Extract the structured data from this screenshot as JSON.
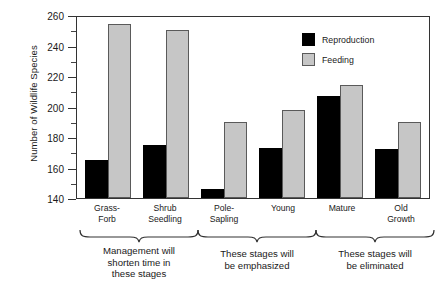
{
  "chart_data": {
    "type": "bar",
    "title": "",
    "xlabel": "",
    "ylabel": "Number of Wildlife Species",
    "ylim": [
      140,
      260
    ],
    "ytick_step": 20,
    "yticks": [
      140,
      160,
      180,
      200,
      220,
      240,
      260
    ],
    "minor_ticks": true,
    "grid": false,
    "legend_position": "top-right",
    "categories": [
      "Grass-\nForb",
      "Shrub\nSeedling",
      "Pole-\nSapling",
      "Young",
      "Mature",
      "Old\nGrowth"
    ],
    "series": [
      {
        "name": "Reproduction",
        "color": "#000000",
        "values": [
          165,
          175,
          146,
          173,
          207,
          172
        ]
      },
      {
        "name": "Feeding",
        "color": "#c6c6c6",
        "values": [
          254,
          250,
          190,
          198,
          214,
          190
        ]
      }
    ],
    "annotations": [
      {
        "text": "Management will shorten time in these stages",
        "covers": [
          "Grass-Forb",
          "Shrub Seedling"
        ]
      },
      {
        "text": "These stages will be emphasized",
        "covers": [
          "Pole-Sapling",
          "Young"
        ]
      },
      {
        "text": "These stages will be eliminated",
        "covers": [
          "Mature",
          "Old Growth"
        ]
      }
    ]
  },
  "axis": {
    "y_title": "Number of Wildlife Species",
    "ytick_labels": [
      "260",
      "240",
      "220",
      "200",
      "180",
      "160",
      "140"
    ]
  },
  "xcategories": [
    {
      "line1": "Grass-",
      "line2": "Forb"
    },
    {
      "line1": "Shrub",
      "line2": "Seedling"
    },
    {
      "line1": "Pole-",
      "line2": "Sapling"
    },
    {
      "line1": "Young",
      "line2": ""
    },
    {
      "line1": "Mature",
      "line2": ""
    },
    {
      "line1": "Old",
      "line2": "Growth"
    }
  ],
  "legend": {
    "items": [
      {
        "label": "Reproduction",
        "swatch": "black-square-icon"
      },
      {
        "label": "Feeding",
        "swatch": "gray-square-icon"
      }
    ]
  },
  "annotations": [
    {
      "line1": "Management will",
      "line2": "shorten time in",
      "line3": "these stages"
    },
    {
      "line1": "These stages will",
      "line2": "be emphasized",
      "line3": ""
    },
    {
      "line1": "These stages will",
      "line2": "be eliminated",
      "line3": ""
    }
  ]
}
